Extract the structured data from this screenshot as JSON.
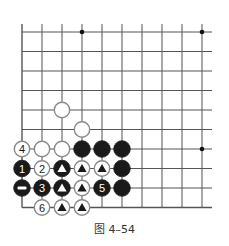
{
  "figure": {
    "caption": "图 4–54"
  },
  "board": {
    "columns": 10,
    "rows": 10,
    "origin_x": 22,
    "origin_y": 32,
    "step_x": 20,
    "step_y": 19.5,
    "top_extend_y": 24,
    "right_extend_x": 212,
    "line_color": "#555555",
    "star_points": [
      {
        "col": 3,
        "row": 0
      },
      {
        "col": 9,
        "row": 0
      },
      {
        "col": 9,
        "row": 6
      }
    ]
  },
  "stones": [
    {
      "col": 2,
      "row": 4,
      "color": "white",
      "label": "",
      "marker": ""
    },
    {
      "col": 3,
      "row": 5,
      "color": "white",
      "label": "",
      "marker": ""
    },
    {
      "col": 0,
      "row": 6,
      "color": "white",
      "label": "4",
      "marker": ""
    },
    {
      "col": 1,
      "row": 6,
      "color": "white",
      "label": "",
      "marker": ""
    },
    {
      "col": 2,
      "row": 6,
      "color": "white",
      "label": "",
      "marker": ""
    },
    {
      "col": 3,
      "row": 6,
      "color": "black",
      "label": "",
      "marker": ""
    },
    {
      "col": 4,
      "row": 6,
      "color": "black",
      "label": "",
      "marker": ""
    },
    {
      "col": 5,
      "row": 6,
      "color": "black",
      "label": "",
      "marker": ""
    },
    {
      "col": 0,
      "row": 7,
      "color": "black",
      "label": "1",
      "marker": ""
    },
    {
      "col": 1,
      "row": 7,
      "color": "white",
      "label": "2",
      "marker": ""
    },
    {
      "col": 2,
      "row": 7,
      "color": "black",
      "label": "",
      "marker": "triangle"
    },
    {
      "col": 3,
      "row": 7,
      "color": "white",
      "label": "",
      "marker": "triangle"
    },
    {
      "col": 4,
      "row": 7,
      "color": "white",
      "label": "",
      "marker": "triangle"
    },
    {
      "col": 5,
      "row": 7,
      "color": "black",
      "label": "",
      "marker": ""
    },
    {
      "col": 0,
      "row": 8,
      "color": "black",
      "label": "",
      "marker": "minus"
    },
    {
      "col": 1,
      "row": 8,
      "color": "black",
      "label": "3",
      "marker": ""
    },
    {
      "col": 2,
      "row": 8,
      "color": "black",
      "label": "",
      "marker": "triangle"
    },
    {
      "col": 3,
      "row": 8,
      "color": "white",
      "label": "",
      "marker": "triangle"
    },
    {
      "col": 4,
      "row": 8,
      "color": "black",
      "label": "5",
      "marker": ""
    },
    {
      "col": 5,
      "row": 8,
      "color": "black",
      "label": "",
      "marker": ""
    },
    {
      "col": 1,
      "row": 9,
      "color": "white",
      "label": "6",
      "marker": ""
    },
    {
      "col": 2,
      "row": 9,
      "color": "white",
      "label": "",
      "marker": "triangle"
    },
    {
      "col": 3,
      "row": 9,
      "color": "white",
      "label": "",
      "marker": "triangle"
    }
  ]
}
